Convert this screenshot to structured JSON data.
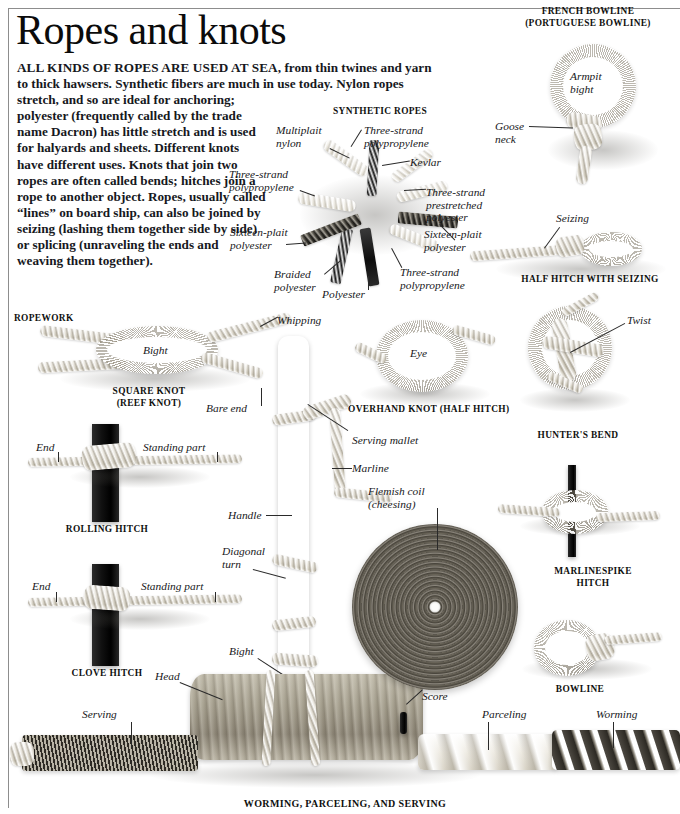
{
  "page": {
    "title": "Ropes and knots",
    "intro": "ALL KINDS OF ROPES ARE USED AT SEA, from thin twines and yarn to thick hawsers. Synthetic fibers are much in use today. Nylon ropes stretch, and so are ideal for anchoring; polyester (frequently called by the trade name Dacron) has little stretch and is used for halyards and sheets. Different knots have different uses. Knots that join two ropes are often called bends; hitches join a rope to another object. Ropes, usually called “lines” on board ship, can also be joined by seizing (lashing them together side by side) or splicing (unraveling the ends and weaving them together).",
    "intro_lead": "ALL KINDS OF ROPES ARE USED AT SEA,",
    "intro_rest": " from thin twines and yarn to thick hawsers. Synthetic fibers are much in use today. Nylon ropes ",
    "intro_narrow": "stretch, and so are ideal for anchoring; polyester (frequently called by the trade name Dacron) has little stretch and is used for halyards and sheets. Different knots have different uses. Knots that join two ropes are often called bends; hitches join a rope to another object. Ropes, usually called “lines” on board ship, can also be joined by seizing (lashing them together side by side) or splicing (unraveling the ends and weaving them together)."
  },
  "sections": {
    "synthetic_ropes": "SYNTHETIC ROPES",
    "ropework": "ROPEWORK",
    "french_bowline": "FRENCH BOWLINE",
    "french_bowline_alt": "(PORTUGUESE BOWLINE)",
    "half_hitch_seizing": "HALF HITCH WITH SEIZING",
    "square_knot": "SQUARE KNOT",
    "square_knot_alt": "(REEF KNOT)",
    "overhand_knot": "OVERHAND KNOT (HALF HITCH)",
    "hunters_bend": "HUNTER'S BEND",
    "rolling_hitch": "ROLLING HITCH",
    "clove_hitch": "CLOVE HITCH",
    "marlinespike_hitch_1": "MARLINESPIKE",
    "marlinespike_hitch_2": "HITCH",
    "bowline": "BOWLINE",
    "worming_parceling_serving": "WORMING, PARCELING, AND SERVING"
  },
  "labels": {
    "multiplait_nylon": "Multiplait\nnylon",
    "multiplait_nylon_l1": "Multiplait",
    "multiplait_nylon_l2": "nylon",
    "three_strand_poly_top_l1": "Three-strand",
    "three_strand_poly_top_l2": "polypropylene",
    "kevlar": "Kevlar",
    "three_strand_poly_left_l1": "Three-strand",
    "three_strand_poly_left_l2": "polypropylene",
    "three_strand_prestretched_l1": "Three-strand",
    "three_strand_prestretched_l2": "prestretched",
    "three_strand_prestretched_l3": "polyester",
    "sixteen_plait_left_l1": "Sixteen-plait",
    "sixteen_plait_left_l2": "polyester",
    "sixteen_plait_right_l1": "Sixteen-plait",
    "sixteen_plait_right_l2": "polyester",
    "braided_polyester_l1": "Braided",
    "braided_polyester_l2": "polyester",
    "polyester": "Polyester",
    "three_strand_poly_bottom_l1": "Three-strand",
    "three_strand_poly_bottom_l2": "polypropylene",
    "armpit_bight_l1": "Armpit",
    "armpit_bight_l2": "bight",
    "goose_neck_l1": "Goose",
    "goose_neck_l2": "neck",
    "seizing": "Seizing",
    "whipping": "Whipping",
    "bight_square_knot": "Bight",
    "bare_end": "Bare end",
    "eye": "Eye",
    "twist": "Twist",
    "end_rolling": "End",
    "standing_part_rolling": "Standing part",
    "end_clove": "End",
    "standing_part_clove": "Standing part",
    "serving_mallet": "Serving mallet",
    "marline": "Marline",
    "flemish_coil_l1": "Flemish coil",
    "flemish_coil_l2": "(cheesing)",
    "handle": "Handle",
    "diagonal_turn_l1": "Diagonal",
    "diagonal_turn_l2": "turn",
    "bight_mallet": "Bight",
    "head": "Head",
    "score": "Score",
    "serving": "Serving",
    "parceling": "Parceling",
    "worming": "Worming"
  },
  "colors": {
    "ink": "#141414",
    "rule": "#8d8d8d",
    "rope_light": "#efece4",
    "rope_dark": "#2b2924",
    "wood": "#a39d8c",
    "coil": "#5a564d"
  }
}
